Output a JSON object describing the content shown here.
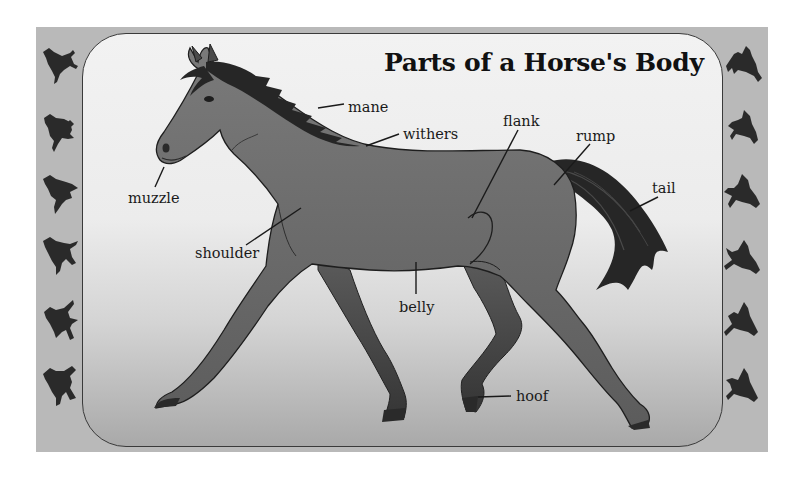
{
  "title": "Parts of a Horse's Body",
  "labels": {
    "mane": "mane",
    "withers": "withers",
    "muzzle": "muzzle",
    "flank": "flank",
    "rump": "rump",
    "tail": "tail",
    "shoulder": "shoulder",
    "belly": "belly",
    "hoof": "hoof"
  },
  "border": {
    "left_silhouettes": 6,
    "right_silhouettes": 6,
    "frame_color": "#b9b9b9",
    "silhouette_color": "#2a2a2a"
  },
  "colors": {
    "horse_body": "#6e6e6e",
    "horse_dark": "#3c3c3c",
    "mane_tail": "#262626",
    "panel_top": "#f2f2f2",
    "panel_bottom": "#a9a9a9"
  }
}
